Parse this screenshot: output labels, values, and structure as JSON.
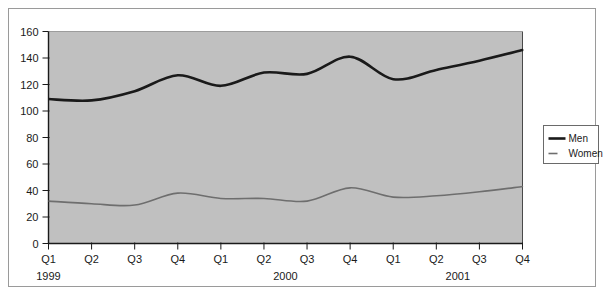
{
  "chart_data": {
    "type": "line",
    "title": "",
    "subtitle": "",
    "xlabel": "",
    "ylabel": "",
    "ylim": [
      0,
      160
    ],
    "ytick_step": 20,
    "yticks": [
      "0",
      "20",
      "40",
      "60",
      "80",
      "100",
      "120",
      "140",
      "160"
    ],
    "grid": false,
    "legend_position": "right-outside",
    "plot_background": "#c0c0c0",
    "categories": [
      "Q1",
      "Q2",
      "Q3",
      "Q4",
      "Q1",
      "Q2",
      "Q3",
      "Q4",
      "Q1",
      "Q2",
      "Q3",
      "Q4"
    ],
    "year_groups": [
      {
        "label": "1999",
        "start_index": 0,
        "end_index": 3
      },
      {
        "label": "2000",
        "start_index": 4,
        "end_index": 7
      },
      {
        "label": "2001",
        "start_index": 8,
        "end_index": 11
      }
    ],
    "series": [
      {
        "name": "Men",
        "color": "#1a1a1a",
        "width": 2.6,
        "values": [
          109,
          108,
          115,
          127,
          119,
          129,
          128,
          141,
          124,
          131,
          138,
          146
        ]
      },
      {
        "name": "Women",
        "color": "#6e6e6e",
        "width": 1.6,
        "values": [
          32,
          30,
          29,
          38,
          34,
          34,
          32,
          42,
          35,
          36,
          39,
          43
        ]
      }
    ]
  },
  "legend": {
    "entries": [
      {
        "label": "Men"
      },
      {
        "label": "Women"
      }
    ]
  },
  "colors": {
    "plot_fill": "#c0c0c0",
    "axis": "#1a1a1a",
    "frame_border": "#9a9a9a",
    "men_line": "#1a1a1a",
    "women_line": "#6e6e6e",
    "text": "#1a1a1a"
  }
}
